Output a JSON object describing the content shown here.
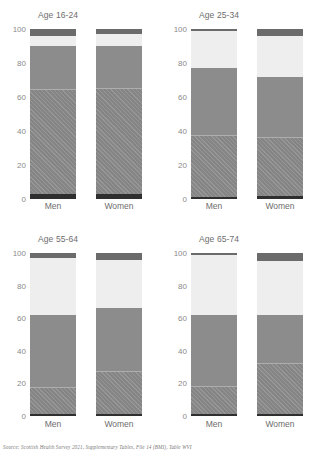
{
  "source_note": "Source: Scottish Health Survey 2021, Supplementary Tables, File 14 (BMI), Table WVI",
  "axis": {
    "ticks": [
      "100",
      "80",
      "60",
      "40",
      "20",
      "0"
    ],
    "tick_values": [
      100,
      80,
      60,
      40,
      20,
      0
    ],
    "ylim": [
      0,
      100
    ]
  },
  "series_names": [
    "Underweight",
    "Healthy weight",
    "Overweight",
    "Obese",
    "Morbidly obese"
  ],
  "colors": {
    "underweight": "#2f2f2f",
    "healthy": "#8c8c8c",
    "overweight": "#8c8c8c",
    "obese": "#eeeeee",
    "morbidly_obese": "#6b6b6b"
  },
  "chart_data": {
    "type": "bar",
    "title": "",
    "subtype": "100% stacked bar, small multiples",
    "xlabel": "",
    "ylabel": "",
    "ylim": [
      0,
      100
    ],
    "grid": false,
    "legend": "none",
    "categories": [
      "Men",
      "Women"
    ],
    "stack_order_bottom_to_top": [
      "Underweight",
      "Healthy weight",
      "Overweight",
      "Obese",
      "Morbidly obese"
    ],
    "panels": [
      {
        "title": "Age 16-24",
        "bars": [
          {
            "category": "Men",
            "values": [
              3,
              61,
              26,
              6,
              4
            ]
          },
          {
            "category": "Women",
            "values": [
              3,
              62,
              25,
              7,
              3
            ]
          }
        ]
      },
      {
        "title": "Age 25-34",
        "bars": [
          {
            "category": "Men",
            "values": [
              1,
              36,
              40,
              22,
              1
            ]
          },
          {
            "category": "Women",
            "values": [
              2,
              34,
              36,
              24,
              4
            ]
          }
        ]
      },
      {
        "title": "Age 55-64",
        "bars": [
          {
            "category": "Men",
            "values": [
              1,
              16,
              45,
              35,
              3
            ]
          },
          {
            "category": "Women",
            "values": [
              1,
              26,
              39,
              30,
              4
            ]
          }
        ]
      },
      {
        "title": "Age 65-74",
        "bars": [
          {
            "category": "Men",
            "values": [
              1,
              17,
              44,
              37,
              1
            ]
          },
          {
            "category": "Women",
            "values": [
              1,
              31,
              30,
              33,
              5
            ]
          }
        ]
      }
    ]
  }
}
